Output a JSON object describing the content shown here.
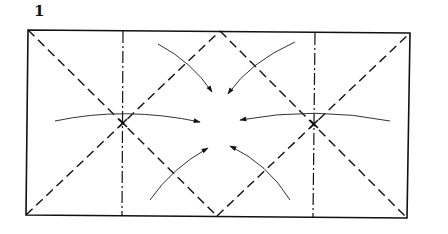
{
  "diagram": {
    "step_number": "1",
    "colors": {
      "line": "#111111",
      "arrow": "#333333",
      "background": "#ffffff"
    },
    "rectangle": {
      "corners": [
        [
          28,
          30
        ],
        [
          410,
          33
        ],
        [
          407,
          218
        ],
        [
          26,
          215
        ]
      ]
    },
    "fold_lines": [
      {
        "type": "valley-dashed",
        "from": [
          28,
          30
        ],
        "to": [
          217,
          216
        ]
      },
      {
        "type": "valley-dashed",
        "from": [
          26,
          215
        ],
        "to": [
          220,
          31
        ]
      },
      {
        "type": "valley-dashed",
        "from": [
          220,
          31
        ],
        "to": [
          407,
          218
        ]
      },
      {
        "type": "valley-dashed",
        "from": [
          217,
          216
        ],
        "to": [
          410,
          33
        ]
      },
      {
        "type": "mountain-dash-dot",
        "from": [
          123,
          31
        ],
        "to": [
          122,
          216
        ]
      },
      {
        "type": "mountain-dash-dot",
        "from": [
          315,
          33
        ],
        "to": [
          313,
          217
        ]
      }
    ],
    "arrows": [
      {
        "id": "left",
        "direction": "right",
        "from": [
          55,
          121
        ],
        "to": [
          200,
          122
        ]
      },
      {
        "id": "right",
        "direction": "left",
        "from": [
          390,
          121
        ],
        "to": [
          240,
          120
        ]
      },
      {
        "id": "top-left",
        "direction": "down-right",
        "from": [
          158,
          44
        ],
        "to": [
          212,
          92
        ]
      },
      {
        "id": "top-right",
        "direction": "down-left",
        "from": [
          295,
          42
        ],
        "to": [
          228,
          94
        ]
      },
      {
        "id": "bottom-left",
        "direction": "up-right",
        "from": [
          150,
          200
        ],
        "to": [
          208,
          148
        ]
      },
      {
        "id": "bottom-right",
        "direction": "up-left",
        "from": [
          290,
          200
        ],
        "to": [
          230,
          146
        ]
      }
    ]
  }
}
